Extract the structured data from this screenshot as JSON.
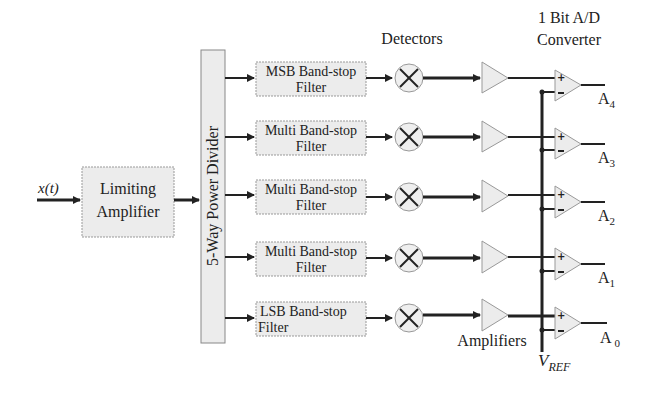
{
  "input_label": "x(t)",
  "limiting_amplifier": {
    "line1": "Limiting",
    "line2": "Amplifier"
  },
  "power_divider": {
    "label": "5-Way Power Divider"
  },
  "headers": {
    "detectors": "Detectors",
    "converter_line1": "1 Bit A/D",
    "converter_line2": "Converter",
    "amplifiers": "Amplifiers",
    "vref": "V",
    "vref_sub": "REF"
  },
  "rows": [
    {
      "filter_line1": "MSB Band-stop",
      "filter_line2": "Filter",
      "output": "A",
      "output_sub": "4",
      "y": 78
    },
    {
      "filter_line1": "Multi Band-stop",
      "filter_line2": "Filter",
      "output": "A",
      "output_sub": "3",
      "y": 137
    },
    {
      "filter_line1": "Multi Band-stop",
      "filter_line2": "Filter",
      "output": "A",
      "output_sub": "2",
      "y": 195
    },
    {
      "filter_line1": "Multi Band-stop",
      "filter_line2": "Filter",
      "output": "A",
      "output_sub": "1",
      "y": 257
    },
    {
      "filter_line1": "LSB Band-stop",
      "filter_line2": "Filter",
      "output": "A",
      "output_sub": "0",
      "y": 318
    }
  ],
  "colors": {
    "block_fill": "#ececec",
    "line": "#222222",
    "block_stroke": "#888888"
  }
}
